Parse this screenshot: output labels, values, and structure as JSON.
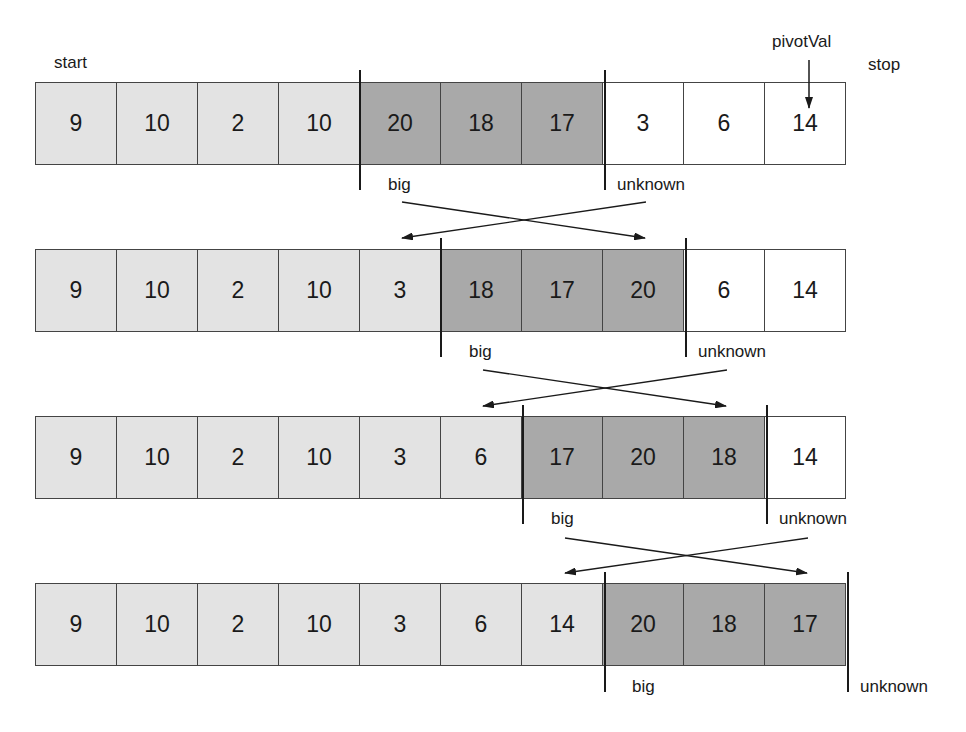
{
  "labels": {
    "start": "start",
    "stop": "stop",
    "pivot": "pivotVal",
    "big": "big",
    "unknown": "unknown"
  },
  "rows": [
    {
      "values": [
        "9",
        "10",
        "2",
        "10",
        "20",
        "18",
        "17",
        "3",
        "6",
        "14"
      ],
      "regions": [
        "small",
        "small",
        "small",
        "small",
        "big",
        "big",
        "big",
        "unknown",
        "unknown",
        "unknown"
      ]
    },
    {
      "values": [
        "9",
        "10",
        "2",
        "10",
        "3",
        "18",
        "17",
        "20",
        "6",
        "14"
      ],
      "regions": [
        "small",
        "small",
        "small",
        "small",
        "small",
        "big",
        "big",
        "big",
        "unknown",
        "unknown"
      ]
    },
    {
      "values": [
        "9",
        "10",
        "2",
        "10",
        "3",
        "6",
        "17",
        "20",
        "18",
        "14"
      ],
      "regions": [
        "small",
        "small",
        "small",
        "small",
        "small",
        "small",
        "big",
        "big",
        "big",
        "unknown"
      ]
    },
    {
      "values": [
        "9",
        "10",
        "2",
        "10",
        "3",
        "6",
        "14",
        "20",
        "18",
        "17"
      ],
      "regions": [
        "small",
        "small",
        "small",
        "small",
        "small",
        "small",
        "small",
        "big",
        "big",
        "big"
      ]
    }
  ],
  "colors": {
    "small": "#e3e3e3",
    "big": "#a9a9a9",
    "unknown": "#ffffff",
    "line": "#1a1a1a"
  }
}
